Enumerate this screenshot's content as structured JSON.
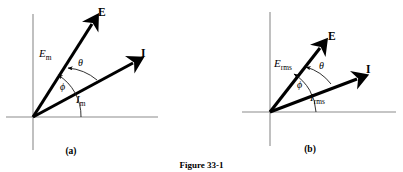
{
  "figure": {
    "caption": "Figure 33-1",
    "background_color": "#ffffff",
    "axis_color": "#8c8c8c",
    "vector_color": "#000000"
  },
  "panels": [
    {
      "id": "a",
      "subcaption": "(a)",
      "origin": {
        "x": 33,
        "y": 117
      },
      "axes": {
        "horizontal": {
          "x1": 6,
          "y1": 117,
          "x2": 158,
          "y2": 117
        },
        "vertical": {
          "x1": 33,
          "y1": 14,
          "x2": 33,
          "y2": 150
        }
      },
      "vectors": [
        {
          "name": "emf-phasor",
          "label": "E",
          "label_style": "bold",
          "magnitude_label": "E",
          "magnitude_subscript": "m",
          "tip": {
            "x": 94,
            "y": 22
          },
          "angle_deg": 58
        },
        {
          "name": "current-phasor",
          "label": "I",
          "label_style": "bold",
          "magnitude_label": "I",
          "magnitude_subscript": "m",
          "tip": {
            "x": 136,
            "y": 61
          },
          "angle_deg": 29
        }
      ],
      "angles": [
        {
          "name": "theta",
          "symbol": "θ",
          "between": "E and I",
          "label_pos": {
            "x": 81,
            "y": 63
          }
        },
        {
          "name": "phi",
          "symbol": "ϕ",
          "between": "E and x-axis",
          "label_pos": {
            "x": 64,
            "y": 87
          }
        }
      ]
    },
    {
      "id": "b",
      "subcaption": "(b)",
      "origin": {
        "x": 70,
        "y": 112
      },
      "axes": {
        "horizontal": {
          "x1": 42,
          "y1": 112,
          "x2": 196,
          "y2": 112
        },
        "vertical": {
          "x1": 70,
          "y1": 12,
          "x2": 70,
          "y2": 146
        }
      },
      "vectors": [
        {
          "name": "emf-phasor",
          "label": "E",
          "label_style": "bold",
          "magnitude_label": "E",
          "magnitude_subscript": "rms",
          "tip": {
            "x": 122,
            "y": 46
          },
          "angle_deg": 52
        },
        {
          "name": "current-phasor",
          "label": "I",
          "label_style": "bold",
          "magnitude_label": "I",
          "magnitude_subscript": "rms",
          "tip": {
            "x": 160,
            "y": 77
          },
          "angle_deg": 29
        }
      ],
      "angles": [
        {
          "name": "theta",
          "symbol": "θ",
          "between": "E and I",
          "label_pos": {
            "x": 117,
            "y": 66
          }
        },
        {
          "name": "phi",
          "symbol": "ϕ",
          "between": "E and x-axis",
          "label_pos": {
            "x": 100,
            "y": 85
          }
        }
      ]
    }
  ]
}
